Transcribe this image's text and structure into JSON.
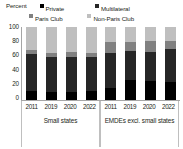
{
  "chart_data": {
    "type": "bar",
    "subtype": "stacked-column",
    "title": "",
    "ylabel": "Percent",
    "xlabel": "",
    "ylim": [
      0,
      100
    ],
    "yticks": [
      "0",
      "20",
      "40",
      "60",
      "80",
      "100"
    ],
    "grid": false,
    "legend_position": "top",
    "categories": [
      "2011",
      "2019",
      "2020",
      "2022",
      "2011",
      "2019",
      "2020",
      "2022"
    ],
    "groups": [
      {
        "label": "Small states",
        "categories": [
          "2011",
          "2019",
          "2020",
          "2022"
        ]
      },
      {
        "label": "EMDEs excl. small states",
        "categories": [
          "2011",
          "2019",
          "2020",
          "2022"
        ]
      }
    ],
    "series": [
      {
        "name": "Private",
        "color": "#000000",
        "values": [
          12,
          11,
          11,
          12,
          17,
          27,
          26,
          24
        ]
      },
      {
        "name": "Multilateral",
        "color": "#262626",
        "values": [
          50,
          48,
          48,
          46,
          47,
          40,
          40,
          45
        ]
      },
      {
        "name": "Paris Club",
        "color": "#808080",
        "values": [
          6,
          5,
          6,
          6,
          15,
          12,
          14,
          11
        ]
      },
      {
        "name": "Non-Paris Club",
        "color": "#bfbfbf",
        "values": [
          32,
          36,
          35,
          36,
          21,
          21,
          20,
          20
        ]
      }
    ]
  },
  "legend": {
    "unit_label": "Percent",
    "items": [
      {
        "label": "Private",
        "color": "#000000",
        "swatch": "legend-swatch-private"
      },
      {
        "label": "Multilateral",
        "color": "#262626",
        "swatch": "legend-swatch-multilateral"
      },
      {
        "label": "Paris Club",
        "color": "#808080",
        "swatch": "legend-swatch-paris-club"
      },
      {
        "label": "Non-Paris Club",
        "color": "#bfbfbf",
        "swatch": "legend-swatch-non-paris-club"
      }
    ]
  },
  "axis": {
    "y_ticks": [
      "100",
      "80",
      "60",
      "40",
      "20",
      "0"
    ]
  }
}
